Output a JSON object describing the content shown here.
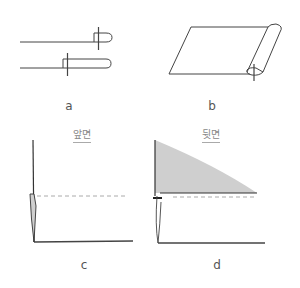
{
  "figures": {
    "a": {
      "label": "a"
    },
    "b": {
      "label": "b"
    },
    "c": {
      "label": "c",
      "side_label": "앞면"
    },
    "d": {
      "label": "d",
      "side_label": "뒷면"
    }
  },
  "colors": {
    "stroke": "#333333",
    "shade": "#cfcfcf",
    "dashed": "#aaaaaa",
    "label": "#555555"
  }
}
